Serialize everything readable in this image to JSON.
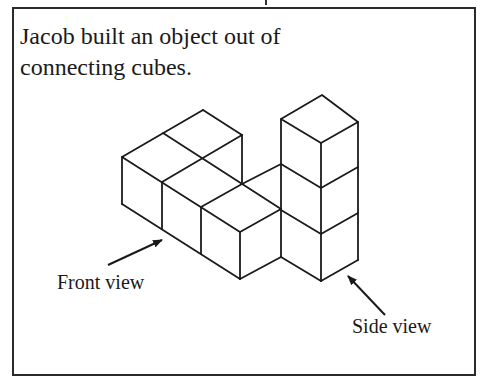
{
  "problem": {
    "text_lines": [
      "Jacob built an object out of",
      "connecting cubes."
    ]
  },
  "figure": {
    "labels": {
      "front_view": "Front view",
      "side_view": "Side view"
    },
    "icons": {
      "front_arrow": "arrow-up-right-icon",
      "side_arrow": "arrow-up-left-icon"
    },
    "stroke_color": "#1a1a1a"
  }
}
